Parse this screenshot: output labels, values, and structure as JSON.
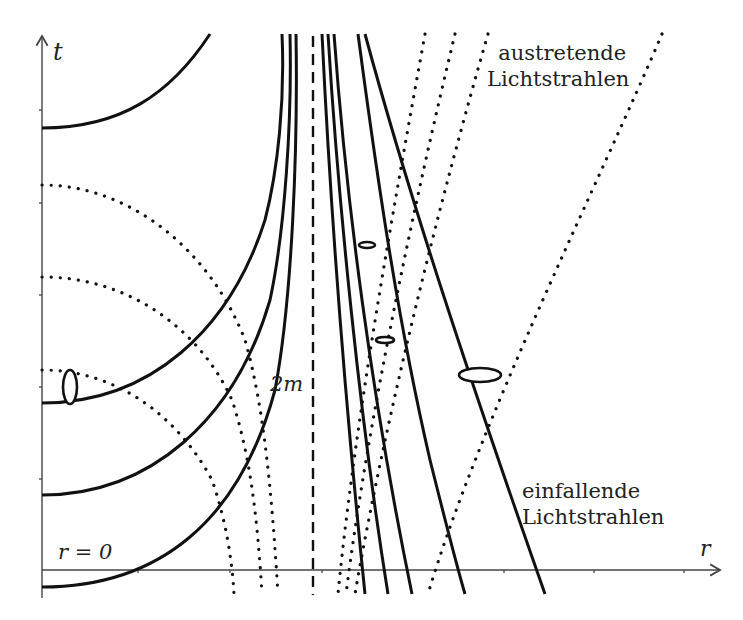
{
  "diagram": {
    "axes": {
      "t_label": "t",
      "r_label": "r",
      "origin_label": "r = 0",
      "horizon_label": "2m"
    },
    "annotations": {
      "outgoing_line1": "austretende",
      "outgoing_line2": "Lichtstrahlen",
      "incoming_line1": "einfallende",
      "incoming_line2": "Lichtstrahlen"
    },
    "colors": {
      "ink": "#111111",
      "axis": "#444444",
      "background": "#ffffff"
    }
  }
}
